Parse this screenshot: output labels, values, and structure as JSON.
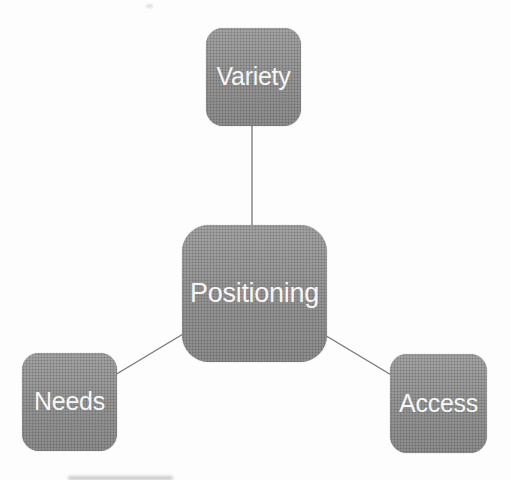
{
  "diagram": {
    "type": "hub-and-spoke",
    "center": {
      "id": "positioning",
      "label": "Positioning"
    },
    "nodes": [
      {
        "id": "variety",
        "label": "Variety",
        "position": "top"
      },
      {
        "id": "needs",
        "label": "Needs",
        "position": "bottom-left"
      },
      {
        "id": "access",
        "label": "Access",
        "position": "bottom-right"
      }
    ],
    "connections": [
      {
        "from": "positioning",
        "to": "variety"
      },
      {
        "from": "positioning",
        "to": "needs"
      },
      {
        "from": "positioning",
        "to": "access"
      }
    ],
    "colors": {
      "background": "#fdfdfd",
      "box_fill": "#8f8f8f",
      "text": "#f6f6f6",
      "connector_line": "#5f5f5f"
    }
  }
}
